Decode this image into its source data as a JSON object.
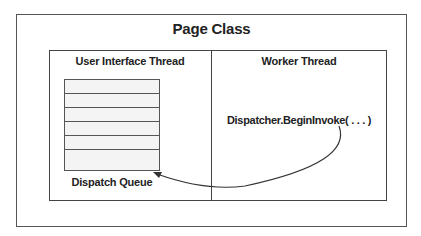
{
  "diagram": {
    "title": "Page Class",
    "columns": [
      {
        "label": "User Interface Thread"
      },
      {
        "label": "Worker Thread"
      }
    ],
    "queue": {
      "label": "Dispatch Queue",
      "slots": 7
    },
    "call": {
      "label": "Dispatcher.BeginInvoke( . . . )"
    },
    "edges": [
      {
        "from": "Dispatcher.BeginInvoke( . . . )",
        "to": "Dispatch Queue",
        "type": "curved-arrow"
      }
    ]
  }
}
